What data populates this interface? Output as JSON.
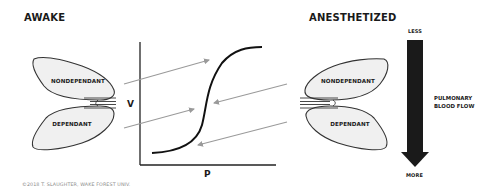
{
  "left_panel": {
    "title": "AWAKE",
    "lobes": {
      "upper": "NONDEPENDANT",
      "lower": "DEPENDANT"
    }
  },
  "right_panel": {
    "title": "ANESTHETIZED",
    "lobes": {
      "upper": "NONDEPENDANT",
      "lower": "DEPENDANT"
    }
  },
  "compliance_chart": {
    "y_axis_label": "V",
    "x_axis_label": "P",
    "curve_type": "sigmoid pressure-volume curve"
  },
  "flow_gradient": {
    "top_label": "LESS",
    "bottom_label": "MORE",
    "label_line1": "PULMONARY",
    "label_line2": "BLOOD FLOW"
  },
  "colors": {
    "lobe_fill": "#f0f0f0",
    "outline": "#333333",
    "arrow_gray": "#9a9a9a",
    "flow_arrow": "#1a1a1a"
  },
  "footer": {
    "copyright": "©2018 T. SLAUGHTER, WAKE FOREST UNIV."
  }
}
